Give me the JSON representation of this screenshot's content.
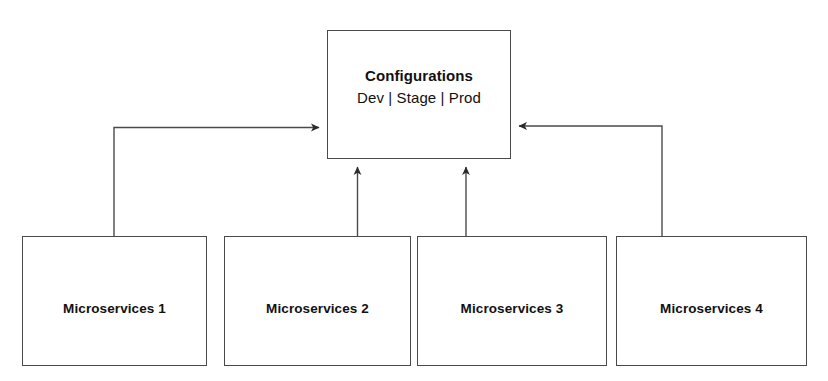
{
  "diagram": {
    "background_color": "#ffffff",
    "line_color": "#4a4a4a",
    "text_color": "#111111",
    "config_node": {
      "title": "Configurations",
      "subtitle": "Dev | Stage | Prod",
      "environments": [
        "Dev",
        "Stage",
        "Prod"
      ]
    },
    "service_nodes": [
      {
        "label": "Microservices 1"
      },
      {
        "label": "Microservices 2"
      },
      {
        "label": "Microservices 3"
      },
      {
        "label": "Microservices 4"
      }
    ],
    "connectors": [
      {
        "name": "microservices-1-to-configurations",
        "style": "elbow",
        "direction": "to-configurations",
        "arrow_at": "configurations-left"
      },
      {
        "name": "microservices-2-to-configurations",
        "style": "straight-vertical",
        "direction": "to-configurations",
        "arrow_at": "configurations-bottom"
      },
      {
        "name": "microservices-3-to-configurations",
        "style": "straight-vertical",
        "direction": "to-configurations",
        "arrow_at": "configurations-bottom"
      },
      {
        "name": "microservices-4-to-configurations",
        "style": "elbow",
        "direction": "to-configurations",
        "arrow_at": "configurations-right"
      }
    ]
  }
}
